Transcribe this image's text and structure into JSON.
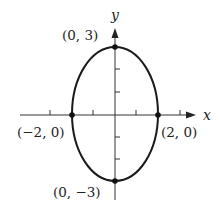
{
  "figure": {
    "type": "ellipse-graph",
    "equation_params": {
      "a": 2,
      "b": 3,
      "center": [
        0,
        0
      ]
    },
    "axes": {
      "x_label": "x",
      "y_label": "y"
    },
    "points": [
      {
        "id": "top",
        "label": "(0, 3)",
        "x": 0,
        "y": 3
      },
      {
        "id": "bottom",
        "label": "(0, −3)",
        "x": 0,
        "y": -3
      },
      {
        "id": "left",
        "label": "(−2, 0)",
        "x": -2,
        "y": 0
      },
      {
        "id": "right",
        "label": "(2, 0)",
        "x": 2,
        "y": 0
      }
    ],
    "x_ticks": [
      -3,
      -2,
      -1,
      1,
      2,
      3
    ],
    "y_ticks": [
      -2,
      -1,
      1,
      2
    ],
    "colors": {
      "stroke": "#1a1a1a",
      "axis": "#333333",
      "background": "#ffffff"
    }
  }
}
